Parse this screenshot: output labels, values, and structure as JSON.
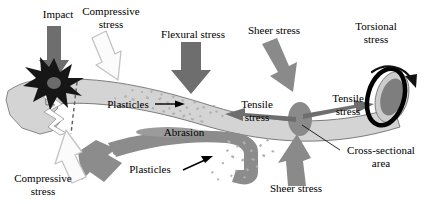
{
  "figure": {
    "background_color": "#ffffff",
    "beam_color": "#d4d4d4",
    "beam_outline_color": "#6f6f6f",
    "dark_arrow_color": "#7a7a7a",
    "abrasion_color": "#8c8c8c",
    "cross_section_color": "#8a8a8a",
    "white_arrow_fill": "#fbfbfb",
    "white_arrow_stroke": "#c3c3c3",
    "impact_star_color": "#1c1c1c",
    "torsion_ring_color": "#000000",
    "particle_color": "#b5b5b5",
    "text_color": "#000000"
  },
  "labels": {
    "impact": "Impact",
    "compressive_stress_top": "Compressive\nstress",
    "compressive_stress_bottom": "Compressive\nstress",
    "flexural_stress": "Flexural stress",
    "sheer_stress_top": "Sheer stress",
    "sheer_stress_bottom": "Sheer stress",
    "torsional_stress": "Torsional\nstress",
    "tensile_stress_left": "Tensile\nstress",
    "tensile_stress_right": "Tensile\nstress",
    "plasticles_inside": "Plasticles",
    "plasticles_below": "Plasticles",
    "abrasion": "Abrasion",
    "cross_sectional_area": "Cross-sectional\narea"
  },
  "elements": {
    "beam": {
      "name": "plastic-beam",
      "description": "long tapering curved beam running left to right, light gray with outline"
    },
    "beam_left_fracture": {
      "name": "fractured-left-end",
      "description": "jagged broken fragment at left end of beam"
    },
    "impact_star": {
      "name": "impact-burst",
      "description": "black starburst at impact point with gray core"
    },
    "crack_line": {
      "name": "crack-dashed-line",
      "description": "vertical dashed line through beam below impact"
    },
    "torsion_ring": {
      "name": "torsion-ring",
      "description": "thick black ellipse ring around beam end with curved arrow"
    },
    "end_cap": {
      "name": "beam-end-cap",
      "description": "dark gray elliptical end face of the beam"
    },
    "cross_section_disc": {
      "name": "cross-sectional-disc",
      "description": "dark gray ellipse marking a cross-section of the beam"
    },
    "abrasion_band": {
      "name": "abrasion-band",
      "description": "dark gray curved band sweeping down from under the beam"
    },
    "particles_inside": {
      "name": "particle-cluster-inside-beam",
      "count": 46
    },
    "particles_below": {
      "name": "particle-cluster-below-beam",
      "count": 20
    }
  },
  "arrows": [
    {
      "name": "impact-arrow",
      "label": "Impact",
      "direction": "down",
      "style": "solid-dark"
    },
    {
      "name": "compressive-stress-top-arrow",
      "label": "Compressive stress",
      "direction": "down-right",
      "style": "outline-white"
    },
    {
      "name": "compressive-stress-bottom-arrow",
      "label": "Compressive stress",
      "direction": "up-right",
      "style": "outline-white"
    },
    {
      "name": "flexural-stress-arrow",
      "label": "Flexural stress",
      "direction": "down",
      "style": "solid-dark"
    },
    {
      "name": "sheer-stress-top-arrow",
      "label": "Sheer stress",
      "direction": "down-right",
      "style": "solid-dark"
    },
    {
      "name": "sheer-stress-bottom-arrow",
      "label": "Sheer stress",
      "direction": "up",
      "style": "solid-dark"
    },
    {
      "name": "torsional-stress-arrow",
      "label": "Torsional stress",
      "direction": "clockwise-curve",
      "style": "solid-black"
    },
    {
      "name": "tensile-stress-left-arrow",
      "label": "Tensile stress",
      "direction": "left",
      "style": "solid-dark"
    },
    {
      "name": "tensile-stress-right-arrow",
      "label": "Tensile stress",
      "direction": "right",
      "style": "solid-dark"
    },
    {
      "name": "abrasion-flow-arrow",
      "label": "Abrasion",
      "direction": "down-left",
      "style": "solid-dark"
    },
    {
      "name": "plasticles-inside-pointer",
      "label": "Plasticles",
      "direction": "right",
      "style": "thin-black"
    },
    {
      "name": "plasticles-below-pointer",
      "label": "Plasticles",
      "direction": "up-right",
      "style": "thin-black"
    },
    {
      "name": "cross-sectional-leader",
      "label": "Cross-sectional area",
      "direction": "leader-line",
      "style": "thin-black"
    }
  ]
}
